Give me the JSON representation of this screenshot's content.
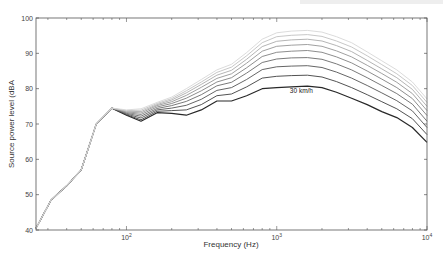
{
  "chart_data": {
    "type": "line",
    "title": "",
    "xlabel": "Frequency (Hz)",
    "ylabel": "Source power level (dBA",
    "xscale": "log",
    "xlim": [
      25,
      10000
    ],
    "ylim": [
      40,
      100
    ],
    "yticks": [
      40,
      50,
      60,
      70,
      80,
      90,
      100
    ],
    "xticks": [
      {
        "value": 100,
        "label": "10",
        "exp": "2"
      },
      {
        "value": 1000,
        "label": "10",
        "exp": "3"
      },
      {
        "value": 10000,
        "label": "10",
        "exp": "4"
      }
    ],
    "grid": false,
    "legend": null,
    "annotations": [
      {
        "text": "30 km/h",
        "x": 1600,
        "y": 79.3
      }
    ],
    "x": [
      25,
      31.5,
      40,
      50,
      63,
      80,
      100,
      125,
      160,
      200,
      250,
      315,
      400,
      500,
      630,
      800,
      1000,
      1250,
      1600,
      2000,
      2500,
      3150,
      4000,
      5000,
      6300,
      8000,
      10000
    ],
    "series": [
      {
        "name": "30 km/h",
        "values": [
          40.5,
          48.5,
          52.5,
          57.0,
          70.0,
          74.5,
          72.5,
          70.8,
          73.2,
          73.0,
          72.5,
          74.0,
          76.5,
          76.5,
          78.0,
          80.0,
          80.3,
          80.5,
          80.7,
          80.3,
          79.0,
          77.3,
          75.5,
          73.5,
          71.8,
          69.0,
          64.8
        ]
      },
      {
        "name": "40 km/h",
        "values": [
          40.5,
          48.5,
          52.5,
          57.0,
          70.0,
          74.5,
          72.6,
          71.2,
          73.6,
          73.8,
          74.0,
          75.5,
          78.0,
          78.5,
          80.5,
          83.0,
          83.5,
          83.7,
          83.8,
          83.3,
          82.0,
          80.3,
          78.3,
          76.3,
          74.3,
          71.5,
          67.0
        ]
      },
      {
        "name": "50 km/h",
        "values": [
          40.5,
          48.5,
          52.5,
          57.0,
          70.0,
          74.5,
          72.8,
          71.7,
          74.0,
          74.5,
          75.3,
          77.0,
          79.5,
          80.3,
          82.6,
          85.4,
          86.2,
          86.4,
          86.5,
          86.0,
          84.7,
          83.0,
          80.9,
          78.8,
          76.6,
          73.7,
          69.0
        ]
      },
      {
        "name": "60 km/h",
        "values": [
          40.5,
          48.5,
          52.5,
          57.0,
          70.0,
          74.5,
          73.0,
          72.2,
          74.4,
          75.2,
          76.4,
          78.3,
          80.8,
          81.8,
          84.4,
          87.4,
          88.4,
          88.7,
          88.8,
          88.3,
          87.0,
          85.3,
          83.1,
          80.9,
          78.6,
          75.6,
          70.8
        ]
      },
      {
        "name": "70 km/h",
        "values": [
          40.5,
          48.5,
          52.5,
          57.0,
          70.0,
          74.5,
          73.2,
          72.7,
          74.8,
          75.8,
          77.3,
          79.4,
          81.9,
          83.1,
          85.9,
          89.1,
          90.3,
          90.6,
          90.8,
          90.3,
          89.0,
          87.3,
          85.0,
          82.7,
          80.3,
          77.2,
          72.4
        ]
      },
      {
        "name": "80 km/h",
        "values": [
          40.5,
          48.5,
          52.5,
          57.0,
          70.0,
          74.5,
          73.4,
          73.1,
          75.2,
          76.3,
          78.1,
          80.4,
          82.9,
          84.2,
          87.2,
          90.6,
          92.0,
          92.3,
          92.5,
          92.0,
          90.7,
          89.0,
          86.6,
          84.3,
          81.8,
          78.6,
          73.8
        ]
      },
      {
        "name": "90 km/h",
        "values": [
          40.5,
          48.5,
          52.5,
          57.0,
          70.0,
          74.5,
          73.6,
          73.5,
          75.5,
          76.8,
          78.8,
          81.2,
          83.8,
          85.2,
          88.3,
          91.9,
          93.4,
          93.8,
          94.0,
          93.5,
          92.2,
          90.5,
          88.0,
          85.6,
          83.1,
          79.8,
          75.0
        ]
      },
      {
        "name": "100 km/h",
        "values": [
          40.5,
          48.5,
          52.5,
          57.0,
          70.0,
          74.5,
          73.8,
          73.9,
          75.8,
          77.2,
          79.4,
          81.9,
          84.6,
          86.1,
          89.3,
          93.0,
          94.7,
          95.1,
          95.3,
          94.8,
          93.5,
          91.8,
          89.3,
          86.8,
          84.2,
          80.9,
          76.1
        ]
      },
      {
        "name": "110 km/h",
        "values": [
          40.5,
          48.5,
          52.5,
          57.0,
          70.0,
          74.5,
          74.0,
          74.3,
          76.1,
          77.6,
          80.0,
          82.6,
          85.3,
          86.9,
          90.2,
          94.0,
          95.8,
          96.3,
          96.5,
          96.0,
          94.7,
          93.0,
          90.4,
          87.9,
          85.3,
          81.9,
          77.1
        ]
      }
    ]
  },
  "header": {
    "topbar_visible": true
  }
}
